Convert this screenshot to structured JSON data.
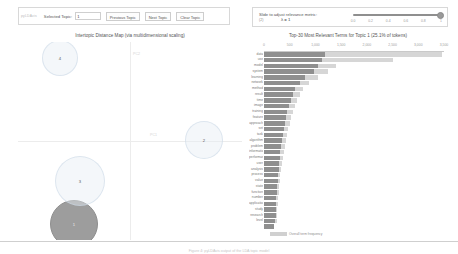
{
  "toolbar": {
    "prefix_label": "pyLDAvis",
    "selected_topic_label": "Selected Topic:",
    "selected_topic_value": "1",
    "previous_topic_label": "Previous Topic",
    "next_topic_label": "Next Topic",
    "clear_topic_label": "Clear Topic"
  },
  "slider": {
    "title": "Slide to adjust relevance metric:",
    "metric_note": "(2)",
    "lambda_label": "λ = 1",
    "value": 1,
    "ticks": [
      "0.0",
      "0.2",
      "0.4",
      "0.6",
      "0.8",
      "1"
    ]
  },
  "left_panel": {
    "title": "Intertopic Distance Map (via multidimensional scaling)",
    "x_axis_label": "PC1",
    "y_axis_label": "PC2",
    "topics": [
      {
        "id": "1",
        "label": "1",
        "cx": 56,
        "cy": 182,
        "r": 24,
        "selected": true
      },
      {
        "id": "2",
        "label": "2",
        "cx": 186,
        "cy": 98,
        "r": 19,
        "selected": false
      },
      {
        "id": "3",
        "label": "3",
        "cx": 62,
        "cy": 139,
        "r": 25,
        "selected": false
      },
      {
        "id": "4",
        "label": "4",
        "cx": 42,
        "cy": 16,
        "r": 18,
        "selected": false
      }
    ]
  },
  "right_panel": {
    "title": "Top-30 Most Relevant Terms for Topic 1 (25.1% of tokens)",
    "legend_overall": "Overall term frequency",
    "legend_estimated": "Estimated term frequency within the selected topic"
  },
  "caption": "Figure 4: pyLDAvis output of the LDA topic model",
  "colors": {
    "bar": "#8f8f8f",
    "bar_overall": "#d6d6d6",
    "circle_fill": "#e6eef5",
    "selected_circle": "#9d9d9d"
  },
  "chart_data": {
    "type": "bar",
    "orientation": "horizontal",
    "title": "Top-30 Most Relevant Terms for Topic 1 (25.1% of tokens)",
    "xlabel": "",
    "ylabel": "",
    "xlim": [
      0,
      3500
    ],
    "xticks": [
      0,
      500,
      1000,
      1500,
      2000,
      2500,
      3000,
      3500
    ],
    "xtick_labels": [
      "0",
      "500",
      "1,000",
      "1,500",
      "2,000",
      "2,500",
      "3,000",
      "3,500"
    ],
    "grid": false,
    "legend_position": "bottom-left",
    "categories": [
      "data",
      "use",
      "model",
      "system",
      "learning",
      "network",
      "method",
      "result",
      "time",
      "image",
      "training",
      "feature",
      "approach",
      "set",
      "task",
      "algorithm",
      "problem",
      "information",
      "performance",
      "user",
      "analysis",
      "process",
      "value",
      "state",
      "function",
      "number",
      "application",
      "study",
      "research",
      "level"
    ],
    "series": [
      {
        "name": "Overall term frequency",
        "values": [
          3470,
          2500,
          1400,
          1250,
          1050,
          880,
          760,
          700,
          640,
          600,
          560,
          530,
          500,
          470,
          440,
          420,
          400,
          380,
          360,
          345,
          330,
          318,
          305,
          295,
          285,
          275,
          268,
          260,
          252,
          245
        ]
      },
      {
        "name": "Estimated term frequency within the selected topic",
        "values": [
          1180,
          1120,
          1050,
          980,
          800,
          700,
          600,
          560,
          520,
          480,
          450,
          430,
          410,
          390,
          370,
          350,
          335,
          320,
          305,
          295,
          285,
          275,
          265,
          258,
          250,
          242,
          236,
          230,
          224,
          218
        ]
      }
    ]
  }
}
